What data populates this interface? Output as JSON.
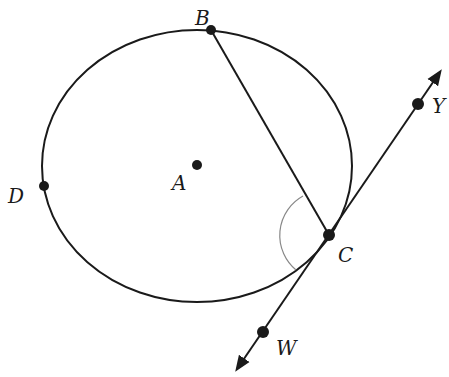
{
  "diagram": {
    "type": "geometry",
    "circle": {
      "center_label": "A"
    },
    "points": [
      {
        "id": "A",
        "label": "A",
        "role": "center"
      },
      {
        "id": "B",
        "label": "B",
        "role": "point on circle"
      },
      {
        "id": "C",
        "label": "C",
        "role": "point of tangency"
      },
      {
        "id": "D",
        "label": "D",
        "role": "point on circle"
      },
      {
        "id": "W",
        "label": "W",
        "role": "point on tangent line"
      },
      {
        "id": "Y",
        "label": "Y",
        "role": "point on tangent line"
      }
    ],
    "segments": [
      {
        "from": "B",
        "to": "C",
        "kind": "chord"
      }
    ],
    "lines": [
      {
        "through": [
          "W",
          "C",
          "Y"
        ],
        "kind": "tangent",
        "arrows": "both"
      }
    ],
    "angle_marks": [
      {
        "vertex": "C",
        "rays": [
          "CB",
          "CW"
        ]
      }
    ],
    "colors": {
      "stroke": "#1a1a1a",
      "angle_arc": "#888888",
      "background": "#ffffff"
    }
  }
}
